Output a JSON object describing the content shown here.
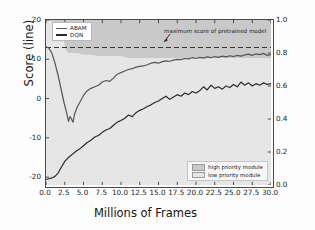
{
  "chart_data": {
    "type": "line",
    "title": "",
    "xlabel": "Millions of Frames",
    "ylabel": "Score (line)",
    "y2label": "Ratio of Selections (area)",
    "xlim": [
      0.0,
      30.0
    ],
    "ylim": [
      -22.0,
      20.0
    ],
    "y2lim": [
      0.0,
      1.0
    ],
    "xticks": [
      "0.0",
      "2.5",
      "5.0",
      "7.5",
      "10.0",
      "12.5",
      "15.0",
      "17.5",
      "20.0",
      "22.5",
      "25.0",
      "27.5",
      "30.0"
    ],
    "xtick_values": [
      0.0,
      2.5,
      5.0,
      7.5,
      10.0,
      12.5,
      15.0,
      17.5,
      20.0,
      22.5,
      25.0,
      27.5,
      30.0
    ],
    "yticks": [
      "20",
      "10",
      "0",
      "-10",
      "-20"
    ],
    "ytick_values": [
      20,
      10,
      0,
      -10,
      -20
    ],
    "y2ticks": [
      "1.0",
      "0.8",
      "0.6",
      "0.4",
      "0.2",
      "0.0"
    ],
    "y2tick_values": [
      1.0,
      0.8,
      0.6,
      0.4,
      0.2,
      0.0
    ],
    "grid": false,
    "legend_position": "upper left",
    "annotations": [
      {
        "text": "maximum score of pretrained model",
        "value": 13.0,
        "kind": "hline-label"
      }
    ],
    "reference_line": {
      "label": "maximum score of pretrained model",
      "y": 13.0,
      "style": "dashed",
      "color": "#333333"
    },
    "series": [
      {
        "name": "ABAM",
        "kind": "line",
        "axis": "left",
        "color": "#555555",
        "x": [
          0.0,
          0.4,
          0.8,
          1.2,
          1.6,
          2.0,
          2.4,
          2.8,
          3.0,
          3.2,
          3.4,
          3.6,
          3.8,
          4.2,
          4.6,
          5.0,
          5.5,
          6.0,
          6.5,
          7.0,
          7.5,
          8.0,
          8.5,
          9.0,
          9.5,
          10.0,
          10.5,
          11.0,
          11.5,
          12.0,
          12.5,
          13.0,
          13.5,
          14.0,
          14.5,
          15.0,
          15.5,
          16.0,
          16.5,
          17.0,
          17.5,
          18.0,
          18.5,
          19.0,
          19.5,
          20.0,
          20.5,
          21.0,
          21.5,
          22.0,
          22.5,
          23.0,
          23.5,
          24.0,
          24.5,
          25.0,
          25.5,
          26.0,
          26.5,
          27.0,
          27.5,
          28.0,
          28.5,
          29.0,
          29.5,
          30.0
        ],
        "y": [
          13.2,
          12.8,
          11.5,
          9.0,
          6.0,
          2.5,
          -1.0,
          -4.0,
          -5.8,
          -4.6,
          -5.2,
          -6.0,
          -4.0,
          -2.0,
          -0.6,
          0.8,
          2.0,
          2.6,
          3.0,
          3.4,
          4.2,
          4.6,
          4.4,
          5.2,
          6.2,
          6.6,
          7.0,
          7.4,
          7.6,
          8.0,
          8.2,
          8.3,
          8.6,
          9.0,
          9.2,
          9.0,
          9.4,
          9.6,
          9.5,
          9.8,
          10.0,
          9.9,
          10.2,
          10.1,
          10.4,
          10.2,
          10.5,
          10.3,
          10.6,
          10.4,
          10.7,
          10.5,
          10.8,
          10.6,
          10.9,
          10.7,
          11.0,
          10.8,
          11.1,
          11.3,
          11.0,
          11.4,
          11.2,
          11.5,
          11.0,
          11.2
        ]
      },
      {
        "name": "DQN",
        "kind": "line",
        "axis": "left",
        "color": "#2b2b2b",
        "x": [
          0.0,
          0.4,
          0.8,
          1.2,
          1.6,
          2.0,
          2.5,
          3.0,
          3.5,
          4.0,
          4.5,
          5.0,
          5.5,
          6.0,
          6.5,
          7.0,
          7.5,
          8.0,
          8.5,
          9.0,
          9.5,
          10.0,
          10.5,
          11.0,
          11.5,
          12.0,
          12.5,
          13.0,
          13.5,
          14.0,
          14.5,
          15.0,
          15.5,
          16.0,
          16.5,
          17.0,
          17.5,
          18.0,
          18.5,
          19.0,
          19.5,
          20.0,
          20.5,
          21.0,
          21.5,
          22.0,
          22.5,
          23.0,
          23.5,
          24.0,
          24.5,
          25.0,
          25.5,
          26.0,
          26.5,
          27.0,
          27.5,
          28.0,
          28.5,
          29.0,
          29.5,
          30.0
        ],
        "y": [
          -20.6,
          -20.4,
          -20.2,
          -19.8,
          -19.0,
          -17.6,
          -16.0,
          -15.0,
          -14.2,
          -13.4,
          -12.8,
          -12.0,
          -11.2,
          -10.6,
          -9.8,
          -9.4,
          -8.6,
          -8.0,
          -7.6,
          -6.8,
          -6.0,
          -5.6,
          -5.0,
          -4.2,
          -4.6,
          -3.6,
          -3.0,
          -2.6,
          -2.0,
          -1.6,
          -1.0,
          -0.6,
          0.0,
          0.6,
          -0.2,
          0.4,
          1.0,
          0.6,
          1.4,
          1.0,
          1.8,
          1.4,
          2.0,
          3.0,
          2.2,
          3.4,
          2.6,
          3.0,
          2.4,
          3.2,
          2.8,
          3.6,
          3.0,
          4.2,
          3.4,
          4.0,
          3.2,
          3.8,
          3.4,
          4.0,
          3.6,
          3.8
        ]
      },
      {
        "name": "high priority module",
        "kind": "area",
        "axis": "right",
        "color": "#c9c9c9",
        "x": [
          0.0,
          1.0,
          2.0,
          2.6,
          3.0,
          4.0,
          5.0,
          6.0,
          7.0,
          8.0,
          9.0,
          10.0,
          11.0,
          12.0,
          13.0,
          14.0,
          15.0,
          16.0,
          17.0,
          18.0,
          19.0,
          20.0,
          21.0,
          22.0,
          23.0,
          24.0,
          25.0,
          26.0,
          27.0,
          28.0,
          29.0,
          30.0
        ],
        "y_lower": [
          1.0,
          0.99,
          0.97,
          0.82,
          0.8,
          0.8,
          0.79,
          0.79,
          0.78,
          0.78,
          0.78,
          0.78,
          0.77,
          0.77,
          0.77,
          0.77,
          0.77,
          0.77,
          0.77,
          0.77,
          0.77,
          0.77,
          0.77,
          0.77,
          0.77,
          0.77,
          0.77,
          0.77,
          0.77,
          0.77,
          0.77,
          0.77
        ],
        "y_upper": [
          1.0,
          1.0,
          1.0,
          1.0,
          1.0,
          1.0,
          1.0,
          1.0,
          1.0,
          1.0,
          1.0,
          1.0,
          1.0,
          1.0,
          1.0,
          1.0,
          1.0,
          1.0,
          1.0,
          1.0,
          1.0,
          1.0,
          1.0,
          1.0,
          1.0,
          1.0,
          1.0,
          1.0,
          1.0,
          1.0,
          1.0,
          1.0
        ]
      },
      {
        "name": "low priority module",
        "kind": "area",
        "axis": "right",
        "color": "#e6e6e6",
        "x": [
          0.0,
          1.0,
          2.0,
          2.6,
          3.0,
          4.0,
          5.0,
          6.0,
          7.0,
          8.0,
          9.0,
          10.0,
          12.0,
          14.0,
          16.0,
          18.0,
          20.0,
          22.0,
          24.0,
          26.0,
          28.0,
          30.0
        ],
        "y_lower": [
          0.0,
          0.0,
          0.0,
          0.0,
          0.0,
          0.0,
          0.0,
          0.0,
          0.0,
          0.0,
          0.0,
          0.0,
          0.0,
          0.0,
          0.0,
          0.0,
          0.0,
          0.0,
          0.0,
          0.0,
          0.0,
          0.0
        ],
        "y_upper": [
          1.0,
          0.99,
          0.97,
          0.82,
          0.8,
          0.8,
          0.79,
          0.79,
          0.78,
          0.78,
          0.78,
          0.78,
          0.77,
          0.77,
          0.77,
          0.77,
          0.77,
          0.77,
          0.77,
          0.77,
          0.77,
          0.77
        ]
      }
    ]
  },
  "legend_lines": {
    "items": [
      {
        "label": "ABAM"
      },
      {
        "label": "DQN"
      }
    ]
  },
  "legend_areas": {
    "items": [
      {
        "label": "high priority module"
      },
      {
        "label": "low priority module"
      }
    ]
  },
  "axes": {
    "xlabel": "Millions of Frames",
    "ylabel_left": "Score (line)",
    "ylabel_right": "Ratio of Selections (area)"
  },
  "annotation": {
    "text": "maximum score of pretrained model"
  },
  "colors": {
    "abam_line": "#555555",
    "dqn_line": "#2b2b2b",
    "high_priority_area": "#c9c9c9",
    "low_priority_area": "#e6e6e6",
    "reference_line": "#333333",
    "frame": "#4a4a4a"
  }
}
